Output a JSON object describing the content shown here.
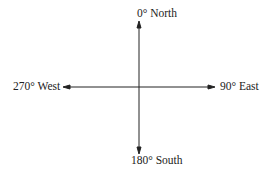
{
  "diagram": {
    "type": "compass-axes",
    "directions": {
      "north": "0° North",
      "east": "90° East",
      "south": "180° South",
      "west": "270° West"
    },
    "colors": {
      "line": "#222222",
      "text": "#222222",
      "background": "#ffffff"
    }
  }
}
